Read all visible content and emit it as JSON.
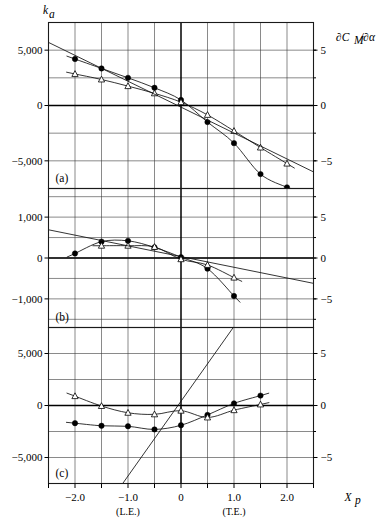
{
  "figure": {
    "title": "",
    "y_axis_left_label": "k",
    "y_axis_left_sub": "a",
    "y_axis_right_label": "∂C",
    "y_axis_right_sub": "M",
    "y_axis_right_label2": "/∂α",
    "x_axis_label": "X",
    "x_axis_sub": "p"
  },
  "x_axis": {
    "min": -2.5,
    "max": 2.5,
    "tick_step": 0.5,
    "labeled_ticks": [
      {
        "value": -2.0,
        "label": "−2.0",
        "sub": ""
      },
      {
        "value": -1.0,
        "label": "−1.0",
        "sub": "(L.E.)"
      },
      {
        "value": 0.0,
        "label": "0",
        "sub": ""
      },
      {
        "value": 1.0,
        "label": "1.0",
        "sub": "(T.E.)"
      },
      {
        "value": 2.0,
        "label": "2.0",
        "sub": ""
      }
    ]
  },
  "panels": [
    {
      "id": "a",
      "label": "(a)",
      "ylim": [
        -7500,
        7500
      ],
      "y_ticks_left": [
        {
          "value": 5000,
          "label": "5,000"
        },
        {
          "value": 0,
          "label": "0"
        },
        {
          "value": -5000,
          "label": "−5,000"
        }
      ],
      "y_ticks_right": [
        {
          "value": 5000,
          "label": "5"
        },
        {
          "value": 0,
          "label": "0"
        },
        {
          "value": -5000,
          "label": "−5"
        }
      ],
      "y_gridlines": [
        -7500,
        -5000,
        -2500,
        0,
        2500,
        5000,
        7500
      ],
      "series": [
        {
          "name": "filled-circles",
          "marker": "filled-circle",
          "x": [
            -2.0,
            -1.5,
            -1.0,
            -0.5,
            0.0,
            0.5,
            1.0,
            1.5,
            2.0
          ],
          "y": [
            4200,
            3350,
            2500,
            1600,
            500,
            -1500,
            -3400,
            -6200,
            -7400
          ]
        },
        {
          "name": "open-triangles",
          "marker": "open-triangle",
          "x": [
            -2.0,
            -1.5,
            -1.0,
            -0.5,
            0.0,
            0.5,
            1.0,
            1.5,
            2.0
          ],
          "y": [
            2850,
            2350,
            1750,
            1100,
            300,
            -850,
            -2300,
            -3800,
            -5250
          ]
        },
        {
          "name": "theory-line",
          "marker": "none",
          "x": [
            -2.5,
            2.5
          ],
          "y": [
            5700,
            -6000
          ]
        }
      ]
    },
    {
      "id": "b",
      "label": "(b)",
      "ylim": [
        -1700,
        1700
      ],
      "y_ticks_left": [
        {
          "value": 1000,
          "label": "1,000"
        },
        {
          "value": 0,
          "label": "0"
        },
        {
          "value": -1000,
          "label": "−1,000"
        }
      ],
      "y_ticks_right": [
        {
          "value": 1000,
          "label": "5"
        },
        {
          "value": 0,
          "label": "0"
        },
        {
          "value": -1000,
          "label": "−5"
        }
      ],
      "y_gridlines": [
        -1500,
        -1000,
        -500,
        0,
        500,
        1000,
        1500
      ],
      "series": [
        {
          "name": "filled-circles",
          "marker": "filled-circle",
          "x": [
            -2.0,
            -1.5,
            -1.0,
            -0.5,
            0.0,
            0.5,
            1.0
          ],
          "y": [
            110,
            400,
            420,
            260,
            20,
            -260,
            -930
          ]
        },
        {
          "name": "open-triangles",
          "marker": "open-triangle",
          "x": [
            -1.5,
            -1.0,
            -0.5,
            0.0,
            0.5,
            1.0
          ],
          "y": [
            300,
            300,
            270,
            -30,
            -170,
            -480
          ]
        },
        {
          "name": "theory-line",
          "marker": "none",
          "x": [
            -2.5,
            2.5
          ],
          "y": [
            690,
            -620
          ]
        }
      ]
    },
    {
      "id": "c",
      "label": "(c)",
      "ylim": [
        -7500,
        7500
      ],
      "y_ticks_left": [
        {
          "value": 5000,
          "label": "5,000"
        },
        {
          "value": 0,
          "label": "0"
        },
        {
          "value": -5000,
          "label": "−5,000"
        }
      ],
      "y_ticks_right": [
        {
          "value": 5000,
          "label": "5"
        },
        {
          "value": 0,
          "label": "0"
        },
        {
          "value": -5000,
          "label": "−5"
        }
      ],
      "y_gridlines": [
        -7500,
        -5000,
        -2500,
        0,
        2500,
        5000,
        7500
      ],
      "series": [
        {
          "name": "filled-circles",
          "marker": "filled-circle",
          "x": [
            -2.0,
            -1.5,
            -1.0,
            -0.5,
            0.0,
            0.5,
            1.0,
            1.5
          ],
          "y": [
            -1700,
            -1950,
            -2000,
            -2300,
            -1900,
            -900,
            200,
            950
          ]
        },
        {
          "name": "open-triangles",
          "marker": "open-triangle",
          "x": [
            -2.0,
            -1.5,
            -1.0,
            -0.5,
            0.0,
            0.5,
            1.0,
            1.5
          ],
          "y": [
            900,
            -50,
            -700,
            -850,
            -500,
            -1150,
            -450,
            100
          ]
        },
        {
          "name": "theory-line",
          "marker": "none",
          "x": [
            -1.1,
            1.0
          ],
          "y": [
            -7500,
            7600
          ]
        }
      ]
    }
  ],
  "colors": {
    "background": "#ffffff",
    "foreground": "#000000",
    "grid": "#3a3a3a"
  }
}
